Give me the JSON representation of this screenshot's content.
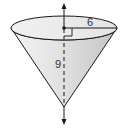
{
  "figure": {
    "type": "right circular cone (inverted)",
    "radius_label": "6",
    "height_label": "9",
    "colors": {
      "stroke": "#1a1a1a",
      "fill_light": "#f2f2f2",
      "fill_dark": "#c8c8c8",
      "top_fill": "#ededed",
      "label": "#333333"
    }
  }
}
